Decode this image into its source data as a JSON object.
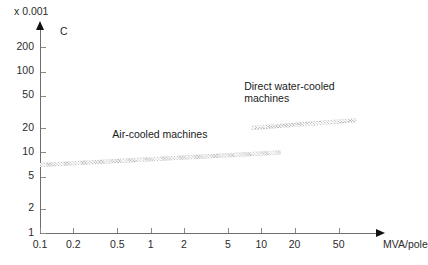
{
  "chart_data": {
    "type": "area",
    "title": "",
    "xlabel": "MVA/pole",
    "ylabel": "C",
    "y_multiplier": "x 0.001",
    "xscale": "log",
    "yscale": "log",
    "grid": false,
    "legend_position": "inline-annotations",
    "xlim": [
      0.1,
      100
    ],
    "ylim": [
      1,
      300
    ],
    "xticks": [
      "0.1",
      "0.2",
      "0.5",
      "1",
      "2",
      "5",
      "10",
      "20",
      "50"
    ],
    "xtick_values": [
      0.1,
      0.2,
      0.5,
      1,
      2,
      5,
      10,
      20,
      50
    ],
    "yticks": [
      "1",
      "2",
      "5",
      "10",
      "20",
      "50",
      "100",
      "200"
    ],
    "ytick_values": [
      1,
      2,
      5,
      10,
      20,
      50,
      100,
      200
    ],
    "series": [
      {
        "name": "Air-cooled machines",
        "x_start": 0.1,
        "x_end": 15,
        "y_start": 7,
        "y_end": 10,
        "band_thickness": 4
      },
      {
        "name": "Direct water-cooled machines",
        "x_start": 8,
        "x_end": 70,
        "y_start": 20,
        "y_end": 25,
        "band_thickness": 4
      }
    ],
    "annotations": [
      {
        "text": "Air-cooled machines",
        "x": 0.45,
        "y": 16
      },
      {
        "text": "Direct water-cooled",
        "x": 7.0,
        "y": 62
      },
      {
        "text": "machines",
        "x": 7.0,
        "y": 44
      }
    ]
  },
  "axes": {
    "y_multiplier_label": "x 0.001",
    "y_symbol": "C",
    "x_unit_label": "MVA/pole"
  },
  "colors": {
    "background": "#ffffff",
    "axis": "#6e6e6e",
    "arrow": "#111111",
    "band_fill": "#b9b9b9",
    "text": "#1a1a1a",
    "tick_label": "#2b2b2b"
  }
}
